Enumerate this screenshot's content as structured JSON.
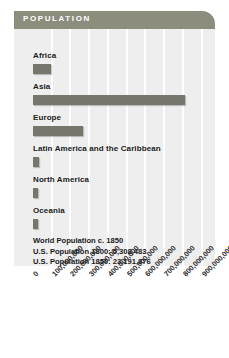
{
  "header": {
    "title": "POPULATION",
    "bar_color": "#8d8d7e",
    "title_color": "#ffffff"
  },
  "panel": {
    "background_color": "#eeeeee",
    "gridline_color": "#fdfdfd"
  },
  "notes": [
    "World Population c. 1850",
    "U.S. Population 1800: 5,308,483",
    "U.S. Population 1850: 23,191,876"
  ],
  "chart_data": {
    "type": "bar",
    "orientation": "horizontal",
    "title": "POPULATION",
    "xlabel": "",
    "ylabel": "",
    "categories": [
      "Africa",
      "Asia",
      "Europe",
      "Latin America and the Caribbean",
      "North America",
      "Oceania"
    ],
    "values": [
      95000000,
      809000000,
      265000000,
      33000000,
      26000000,
      2000000
    ],
    "xlim": [
      0,
      950000000
    ],
    "tick_values": [
      0,
      100000000,
      200000000,
      300000000,
      400000000,
      500000000,
      600000000,
      700000000,
      800000000,
      900000000
    ],
    "tick_labels": [
      "0",
      "100,000,000",
      "200,000,000",
      "300,000,000",
      "400,000,000",
      "500,000,000",
      "600,000,000",
      "700,000,000",
      "800,000,000",
      "900,000,000"
    ],
    "grid": true,
    "legend": false,
    "bar_color": "#76766c"
  }
}
